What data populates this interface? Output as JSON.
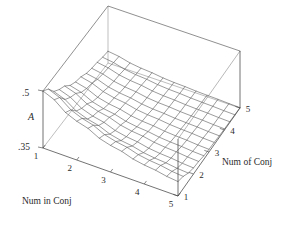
{
  "figure": {
    "type": "3d-surface-plot",
    "background": "#ffffff",
    "line_color": "#555555",
    "frame_color": "#444444"
  },
  "axes": {
    "vertical": {
      "label": "A",
      "tick_high": ".5",
      "tick_low": ".35",
      "min": 0.35,
      "max": 0.5
    },
    "left": {
      "label": "Num in Conj",
      "ticks": [
        "1",
        "2",
        "3",
        "4",
        "5"
      ]
    },
    "right": {
      "label": "Num of Conj",
      "ticks": [
        "1",
        "2",
        "3",
        "4",
        "5"
      ]
    }
  },
  "chart_data": {
    "type": "surface",
    "title": "",
    "xlabel": "Num in Conj",
    "ylabel": "Num of Conj",
    "zlabel": "A",
    "xticks": [
      1,
      2,
      3,
      4,
      5
    ],
    "yticks": [
      1,
      2,
      3,
      4,
      5
    ],
    "zticks": [
      0.35,
      0.5
    ],
    "zlim": [
      0.35,
      0.5
    ],
    "xlim": [
      1,
      5
    ],
    "ylim": [
      1,
      5
    ],
    "grid": true,
    "legend": "none",
    "x": [
      1,
      2,
      3,
      4,
      5
    ],
    "y": [
      1,
      2,
      3,
      4,
      5
    ],
    "z": [
      [
        0.5,
        0.448,
        0.412,
        0.392,
        0.381
      ],
      [
        0.452,
        0.409,
        0.385,
        0.373,
        0.366
      ],
      [
        0.42,
        0.386,
        0.37,
        0.362,
        0.358
      ],
      [
        0.4,
        0.373,
        0.362,
        0.357,
        0.354
      ],
      [
        0.388,
        0.366,
        0.357,
        0.353,
        0.351
      ]
    ],
    "z_note": "z[i][j] : i indexes Num in Conj (1..5), j indexes Num of Conj (1..5)"
  }
}
